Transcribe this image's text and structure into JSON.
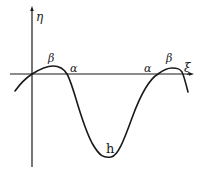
{
  "diagram": {
    "axes": {
      "vertical_label": "η",
      "horizontal_label": "ξ"
    },
    "labels": {
      "beta_left": "β",
      "alpha_left": "α",
      "alpha_right": "α",
      "beta_right": "β",
      "trough": "h"
    },
    "colors": {
      "stroke": "#1a1a1a",
      "background": "#ffffff"
    }
  }
}
